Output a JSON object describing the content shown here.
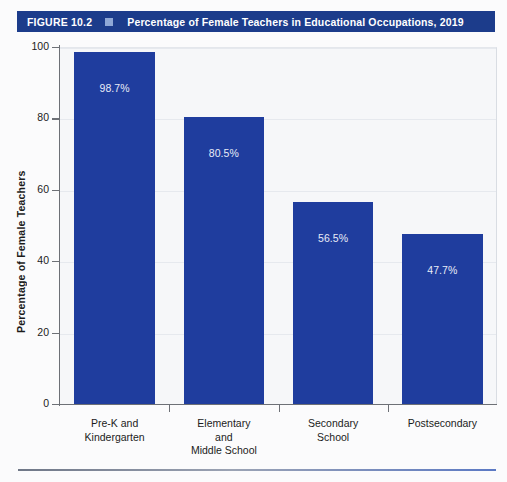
{
  "figure": {
    "number_label": "FIGURE 10.2",
    "marker_icon": "small-square-marker",
    "title": "Percentage of Female Teachers in Educational Occupations, 2019",
    "title_bar_color": "#1c3c8b",
    "marker_color": "#8fa8d6"
  },
  "chart_data": {
    "type": "bar",
    "title": "Percentage of Female Teachers in Educational Occupations, 2019",
    "xlabel": "",
    "ylabel": "Percentage of Female Teachers",
    "categories": [
      "Pre-K and\nKindergarten",
      "Elementary\nand\nMiddle School",
      "Secondary\nSchool",
      "Postsecondary"
    ],
    "values": [
      98.7,
      80.5,
      56.5,
      47.7
    ],
    "value_labels": [
      "98.7%",
      "80.5%",
      "56.5%",
      "47.7%"
    ],
    "ylim": [
      0,
      100
    ],
    "yticks": [
      0,
      20,
      40,
      60,
      80,
      100
    ],
    "ytick_labels": [
      "0",
      "20",
      "40",
      "60",
      "80",
      "100"
    ],
    "grid": true,
    "legend": false,
    "bar_color": "#1f3d9e",
    "bar_label_color": "#e8ecf7",
    "plot_background": "#f6f7f9"
  }
}
